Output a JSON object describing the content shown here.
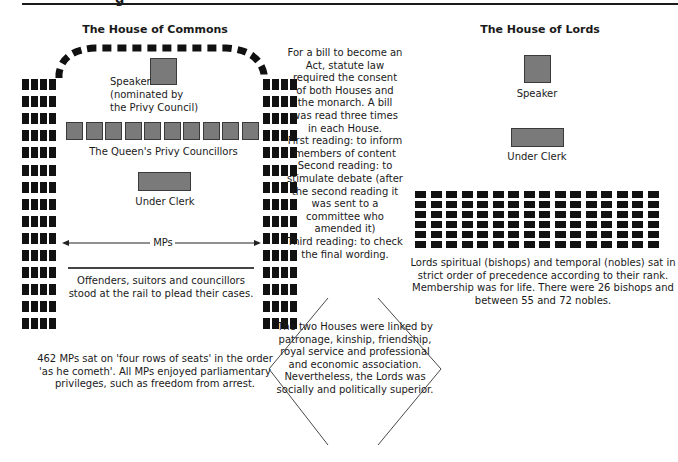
{
  "page": {
    "top_title_fragment": "g"
  },
  "commons": {
    "title": "The House of Commons",
    "speaker_label": "Speaker\n(nominated by\nthe Privy Council)",
    "privy_councillors_label": "The Queen's Privy Councillors",
    "privy_councillor_seats": 10,
    "under_clerk_label": "Under Clerk",
    "mps_label": "MPs",
    "rail_label": "Offenders, suitors and councillors stood at the rail to plead their cases.",
    "bench_columns": 4,
    "bench_rows": 15,
    "caption": "462 MPs sat on 'four rows of seats' in the order 'as he cometh'. All MPs enjoyed parliamentary privileges, such as freedom from arrest."
  },
  "bill_process": {
    "intro": "For a bill to become an Act, statute law required the consent of both Houses and the monarch. A bill was read three times in each House.",
    "readings": [
      "First reading: to inform members of content",
      "Second reading: to stimulate debate (after the second reading it was sent to a committee who amended it)",
      "Third reading: to check the final wording."
    ]
  },
  "link_box": {
    "text": "The two Houses were linked by patronage, kinship, friendship, royal service and professional and economic association. Nevertheless, the Lords was socially and politically superior."
  },
  "lords": {
    "title": "The House of Lords",
    "speaker_label": "Speaker",
    "under_clerk_label": "Under Clerk",
    "seat_columns": 16,
    "seat_rows": 6,
    "caption": "Lords spiritual (bishops) and temporal (nobles) sat in strict order of precedence according to their rank. Membership was for life. There were 26 bishops and between 55 and 72 nobles."
  },
  "colors": {
    "seat_black": "#111111",
    "seat_grey": "#7a7a7a",
    "line": "#1a1a1a"
  }
}
